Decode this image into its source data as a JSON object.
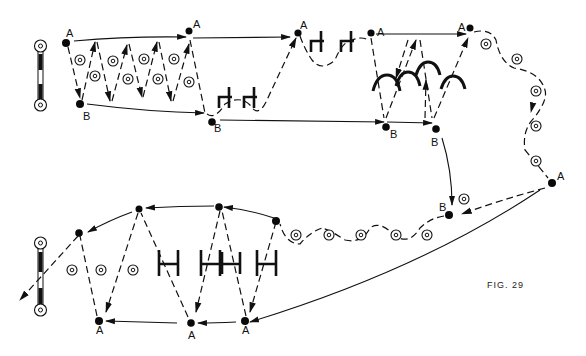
{
  "figure": {
    "caption": "FIG. 29",
    "background": "#ffffff",
    "ink": "#111111"
  },
  "labels": {
    "A": "A",
    "B": "B"
  },
  "points": {
    "top": [
      {
        "id": "A1",
        "label": "A",
        "x": 66,
        "y": 43
      },
      {
        "id": "B1",
        "label": "B",
        "x": 80,
        "y": 104
      },
      {
        "id": "A2",
        "label": "A",
        "x": 189,
        "y": 31
      },
      {
        "id": "B2",
        "label": "B",
        "x": 212,
        "y": 122
      },
      {
        "id": "A3",
        "label": "A",
        "x": 298,
        "y": 33
      },
      {
        "id": "A4",
        "label": "A",
        "x": 371,
        "y": 33
      },
      {
        "id": "B3",
        "label": "B",
        "x": 386,
        "y": 128
      },
      {
        "id": "A5",
        "label": "A",
        "x": 470,
        "y": 28
      },
      {
        "id": "B4",
        "label": "B",
        "x": 436,
        "y": 128
      }
    ],
    "right": [
      {
        "id": "A6",
        "label": "A",
        "x": 552,
        "y": 183
      },
      {
        "id": "B5",
        "label": "B",
        "x": 449,
        "y": 215
      }
    ],
    "bottom": [
      {
        "id": "P1",
        "label": "",
        "x": 276,
        "y": 221
      },
      {
        "id": "P2",
        "label": "",
        "x": 219,
        "y": 207
      },
      {
        "id": "P3",
        "label": "",
        "x": 139,
        "y": 209
      },
      {
        "id": "P4",
        "label": "",
        "x": 79,
        "y": 233
      },
      {
        "id": "A7",
        "label": "A",
        "x": 245,
        "y": 321
      },
      {
        "id": "A8",
        "label": "A",
        "x": 191,
        "y": 323
      },
      {
        "id": "A9",
        "label": "A",
        "x": 99,
        "y": 321
      }
    ]
  },
  "markers": {
    "circle_target_count": 24,
    "gate_h_count": 4,
    "gate_arch_count": 4,
    "gate_bracket_count": 6,
    "post_count": 2
  }
}
